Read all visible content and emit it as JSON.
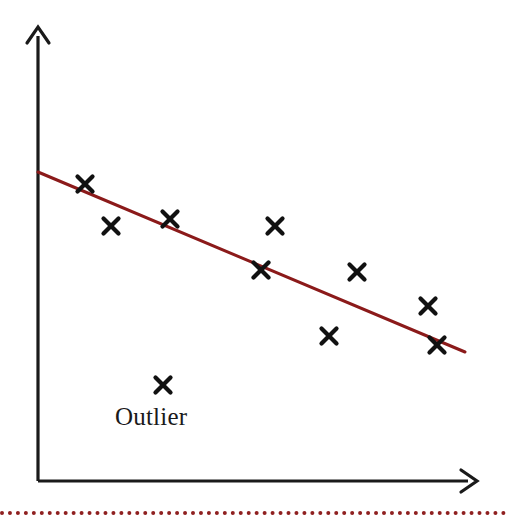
{
  "figure": {
    "width": 506,
    "height": 515,
    "background": "#ffffff"
  },
  "annotations": {
    "outlier_label": "Outlier"
  },
  "colors": {
    "axis": "#1a1a1a",
    "marker": "#111111",
    "regression_line": "#8B1A1A",
    "bottom_rule": "#8f2020",
    "label_text": "#1a1a1a"
  },
  "axes": {
    "origin": {
      "x": 38,
      "y": 481
    },
    "y_axis": {
      "x": 38,
      "y_top": 28,
      "y_bottom": 481,
      "arrow": "up-arrow"
    },
    "x_axis": {
      "y": 481,
      "x_left": 38,
      "x_right": 477,
      "arrow": "right-arrow"
    },
    "ticks": [],
    "tick_labels": [],
    "grid": false,
    "xlabel": "",
    "ylabel": ""
  },
  "chart_data": {
    "type": "scatter",
    "title": "",
    "subtitle": "",
    "xlabel": "",
    "ylabel": "",
    "grid": false,
    "legend": false,
    "xlim": [
      38,
      477
    ],
    "ylim": [
      481,
      28
    ],
    "note": "Axis values are unlabeled; coordinates given in pixel space of the figure.",
    "series": [
      {
        "name": "data points",
        "marker": "x",
        "color": "#111111",
        "points": [
          {
            "x": 85,
            "y": 184
          },
          {
            "x": 111,
            "y": 226
          },
          {
            "x": 170,
            "y": 219
          },
          {
            "x": 261,
            "y": 270
          },
          {
            "x": 275,
            "y": 226
          },
          {
            "x": 329,
            "y": 336
          },
          {
            "x": 357,
            "y": 272
          },
          {
            "x": 428,
            "y": 306
          },
          {
            "x": 437,
            "y": 345
          }
        ]
      },
      {
        "name": "outlier",
        "marker": "x",
        "color": "#111111",
        "points": [
          {
            "x": 163,
            "y": 385
          }
        ],
        "annotation": "Outlier"
      }
    ],
    "trendline": {
      "name": "regression line",
      "color": "#8B1A1A",
      "width": 3,
      "x0": 38,
      "y0": 172,
      "x1": 465,
      "y1": 352
    }
  },
  "decorations": {
    "bottom_rule_style": "dotted"
  }
}
